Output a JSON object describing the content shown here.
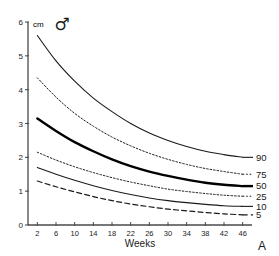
{
  "chart_data": {
    "type": "line",
    "title": "",
    "subtitle": "",
    "panel_label": "A",
    "sex_symbol": "♂",
    "sex_symbol_name": "male-symbol",
    "xlabel": "Weeks",
    "ylabel": "cm",
    "xlim": [
      0,
      48
    ],
    "ylim": [
      0,
      6
    ],
    "grid": false,
    "legend_position": "right-of-curve-ends",
    "x_ticks": [
      2,
      6,
      10,
      14,
      18,
      22,
      26,
      30,
      34,
      38,
      42,
      46
    ],
    "x_tick_labels": [
      "2",
      "6",
      "10",
      "14",
      "18",
      "22",
      "26",
      "30",
      "34",
      "38",
      "42",
      "46"
    ],
    "y_ticks": [
      0,
      1,
      2,
      3,
      4,
      5,
      6
    ],
    "y_tick_labels": [
      "0",
      "1",
      "2",
      "3",
      "4",
      "5",
      "6"
    ],
    "x": [
      2,
      6,
      10,
      14,
      18,
      22,
      26,
      30,
      34,
      38,
      42,
      46
    ],
    "series": [
      {
        "name": "90",
        "label": "90",
        "style": "solid",
        "width": 1.1,
        "color": "#1a1a1a",
        "values": [
          5.6,
          4.85,
          4.25,
          3.75,
          3.35,
          3.0,
          2.72,
          2.5,
          2.32,
          2.18,
          2.08,
          2.0
        ]
      },
      {
        "name": "75",
        "label": "75",
        "style": "dotted",
        "width": 1.0,
        "color": "#1a1a1a",
        "values": [
          4.35,
          3.78,
          3.3,
          2.92,
          2.6,
          2.34,
          2.12,
          1.94,
          1.79,
          1.67,
          1.58,
          1.5
        ]
      },
      {
        "name": "50",
        "label": "50",
        "style": "solid",
        "width": 2.4,
        "color": "#000000",
        "values": [
          3.15,
          2.78,
          2.45,
          2.18,
          1.94,
          1.74,
          1.58,
          1.45,
          1.34,
          1.25,
          1.19,
          1.15
        ]
      },
      {
        "name": "25",
        "label": "25",
        "style": "dotted",
        "width": 1.0,
        "color": "#1a1a1a",
        "values": [
          2.15,
          1.92,
          1.72,
          1.55,
          1.4,
          1.27,
          1.16,
          1.06,
          0.99,
          0.93,
          0.88,
          0.85
        ]
      },
      {
        "name": "10",
        "label": "10",
        "style": "solid",
        "width": 1.1,
        "color": "#1a1a1a",
        "values": [
          1.7,
          1.5,
          1.32,
          1.16,
          1.02,
          0.9,
          0.8,
          0.72,
          0.66,
          0.61,
          0.57,
          0.55
        ]
      },
      {
        "name": "5",
        "label": "5",
        "style": "dashed",
        "width": 1.2,
        "color": "#1a1a1a",
        "values": [
          1.3,
          1.13,
          0.98,
          0.84,
          0.72,
          0.62,
          0.54,
          0.47,
          0.42,
          0.37,
          0.33,
          0.3
        ]
      }
    ]
  },
  "axes": {
    "unit_label": "cm",
    "x_title": "Weeks",
    "panel_letter": "A",
    "sex": "♂"
  },
  "colors": {
    "axis": "#4a4a4a",
    "ink": "#1a1a1a",
    "background": "#ffffff",
    "median": "#000000"
  }
}
